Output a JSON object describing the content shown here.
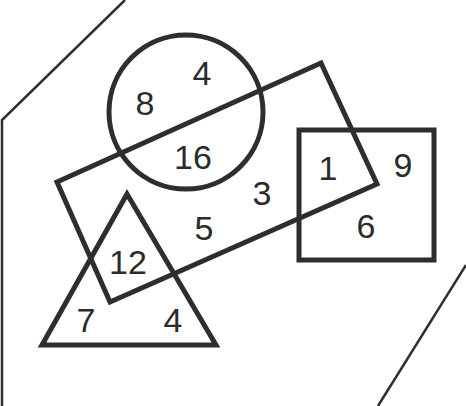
{
  "diagram": {
    "type": "venn-style shape diagram",
    "stroke_color": "#2e2e2e",
    "background": "#ffffff",
    "shapes": {
      "outer_region": "hexagonal outline (partially cropped)",
      "circle": "circle",
      "rectangle": "rotated rectangle",
      "square": "square",
      "triangle": "triangle"
    },
    "labels": [
      {
        "id": "circle-only-top",
        "value": "4",
        "x": 202,
        "y": 73
      },
      {
        "id": "circle-only-left",
        "value": "8",
        "x": 145,
        "y": 103
      },
      {
        "id": "circle-rectangle",
        "value": "16",
        "x": 193,
        "y": 157
      },
      {
        "id": "rectangle-square",
        "value": "1",
        "x": 328,
        "y": 168
      },
      {
        "id": "square-only-right",
        "value": "9",
        "x": 403,
        "y": 165
      },
      {
        "id": "rectangle-only-upper",
        "value": "3",
        "x": 262,
        "y": 193
      },
      {
        "id": "square-only-bottom",
        "value": "6",
        "x": 366,
        "y": 226
      },
      {
        "id": "rectangle-only-lower",
        "value": "5",
        "x": 204,
        "y": 228
      },
      {
        "id": "triangle-rectangle",
        "value": "12",
        "x": 128,
        "y": 262
      },
      {
        "id": "triangle-only-left",
        "value": "7",
        "x": 86,
        "y": 320
      },
      {
        "id": "triangle-only-right",
        "value": "4",
        "x": 173,
        "y": 320
      }
    ]
  }
}
